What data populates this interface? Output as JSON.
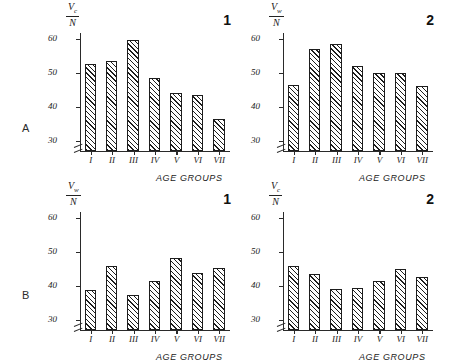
{
  "figure": {
    "row_labels": [
      {
        "id": "A",
        "label": "A"
      },
      {
        "id": "B",
        "label": "B"
      }
    ],
    "axis_title_x": "AGE GROUPS",
    "categories": [
      "I",
      "II",
      "III",
      "IV",
      "V",
      "VI",
      "VII"
    ],
    "y_ticks": [
      "30",
      "40",
      "50",
      "60"
    ]
  },
  "chart_data": [
    {
      "id": "A1",
      "type": "bar",
      "panel_number": "1",
      "row": "A",
      "title": "",
      "ylabel_numerator": "V",
      "ylabel_subscript": "c",
      "ylabel_denominator": "N",
      "xlabel": "AGE GROUPS",
      "categories": [
        "I",
        "II",
        "III",
        "IV",
        "V",
        "VI",
        "VII"
      ],
      "values": [
        52.5,
        53.5,
        59.5,
        48.5,
        44.0,
        43.5,
        36.5
      ],
      "ylim": [
        27,
        62
      ],
      "yticks": [
        30,
        40,
        50,
        60
      ],
      "axis_break": true,
      "grid": false,
      "legend": "none"
    },
    {
      "id": "A2",
      "type": "bar",
      "panel_number": "2",
      "row": "A",
      "title": "",
      "ylabel_numerator": "V",
      "ylabel_subscript": "w",
      "ylabel_denominator": "N",
      "xlabel": "AGE GROUPS",
      "categories": [
        "I",
        "II",
        "III",
        "IV",
        "V",
        "VI",
        "VII"
      ],
      "values": [
        46.5,
        57.0,
        58.5,
        52.0,
        50.0,
        50.0,
        46.0
      ],
      "ylim": [
        27,
        62
      ],
      "yticks": [
        30,
        40,
        50,
        60
      ],
      "axis_break": true,
      "grid": false,
      "legend": "none"
    },
    {
      "id": "B1",
      "type": "bar",
      "panel_number": "1",
      "row": "B",
      "title": "",
      "ylabel_numerator": "V",
      "ylabel_subscript": "w",
      "ylabel_denominator": "N",
      "xlabel": "AGE GROUPS",
      "categories": [
        "I",
        "II",
        "III",
        "IV",
        "V",
        "VI",
        "VII"
      ],
      "values": [
        38.8,
        45.8,
        37.3,
        41.5,
        48.0,
        43.8,
        45.3
      ],
      "ylim": [
        27,
        62
      ],
      "yticks": [
        30,
        40,
        50,
        60
      ],
      "axis_break": true,
      "grid": false,
      "legend": "none"
    },
    {
      "id": "B2",
      "type": "bar",
      "panel_number": "2",
      "row": "B",
      "title": "",
      "ylabel_numerator": "V",
      "ylabel_subscript": "c",
      "ylabel_denominator": "N",
      "xlabel": "AGE GROUPS",
      "categories": [
        "I",
        "II",
        "III",
        "IV",
        "V",
        "VI",
        "VII"
      ],
      "values": [
        45.8,
        43.3,
        39.0,
        39.3,
        41.5,
        45.0,
        42.5
      ],
      "ylim": [
        27,
        62
      ],
      "yticks": [
        30,
        40,
        50,
        60
      ],
      "axis_break": true,
      "grid": false,
      "legend": "none"
    }
  ]
}
